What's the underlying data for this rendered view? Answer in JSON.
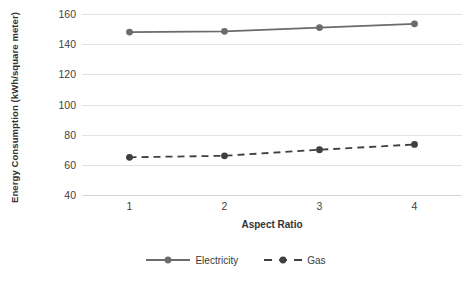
{
  "chart_data": {
    "type": "line",
    "title": "",
    "xlabel": "Aspect Ratio",
    "ylabel": "Energy Consumption (kWh/square meter)",
    "categories": [
      "1",
      "2",
      "3",
      "4"
    ],
    "x": [
      1,
      2,
      3,
      4
    ],
    "xlim": [
      0.5,
      4.5
    ],
    "ylim": [
      40,
      160
    ],
    "yticks": [
      40,
      60,
      80,
      100,
      120,
      140,
      160
    ],
    "ytick_labels": [
      "40",
      "60",
      "80",
      "100",
      "120",
      "140",
      "160"
    ],
    "grid": "horizontal",
    "legend_position": "bottom-center",
    "series": [
      {
        "name": "Electricity",
        "values": [
          148,
          148.5,
          151,
          153.5
        ],
        "color": "#6b6b6b",
        "line_style": "solid",
        "marker": "circle"
      },
      {
        "name": "Gas",
        "values": [
          65,
          66,
          70,
          73.5
        ],
        "color": "#3f3f3f",
        "line_style": "dashed",
        "marker": "circle"
      }
    ]
  },
  "axes": {
    "y_title": "Energy Consumption (kWh/square meter)",
    "x_title": "Aspect Ratio",
    "y_ticks": [
      "160",
      "140",
      "120",
      "100",
      "80",
      "60",
      "40"
    ],
    "x_ticks": [
      "1",
      "2",
      "3",
      "4"
    ]
  },
  "legend": {
    "items": [
      {
        "label": "Electricity",
        "color": "#6b6b6b",
        "style": "solid"
      },
      {
        "label": "Gas",
        "color": "#3f3f3f",
        "style": "dashed"
      }
    ]
  },
  "colors": {
    "gridline": "#e2e2e2",
    "axis": "#d4d4d4",
    "electricity": "#6b6b6b",
    "gas": "#3f3f3f",
    "background": "#ffffff",
    "text": "#3a3a3a"
  }
}
